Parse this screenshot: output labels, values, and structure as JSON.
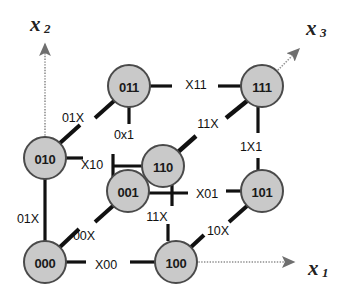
{
  "figure": {
    "type": "diagram",
    "subtype": "binary-hypercube-3d",
    "background_color": "#ffffff",
    "node_fill": "#c9c9c9",
    "node_stroke": "#4a4a4a",
    "edge_color": "#111111",
    "axis_color": "#8a8a8a",
    "thin_edge_color": "#6e6e6e"
  },
  "axes": [
    {
      "id": "x1",
      "base": "x",
      "sub": "1",
      "x": 316,
      "y": 268,
      "arrow_from": [
        176,
        262
      ],
      "arrow_to": [
        296,
        262
      ],
      "style": "dotted"
    },
    {
      "id": "x2",
      "base": "x",
      "sub": "2",
      "x": 38,
      "y": 24,
      "arrow_from": [
        45,
        158
      ],
      "arrow_to": [
        45,
        42
      ],
      "style": "dotted"
    },
    {
      "id": "x3",
      "base": "x",
      "sub": "3",
      "x": 314,
      "y": 28,
      "arrow_from": [
        262,
        86
      ],
      "arrow_to": [
        300,
        48
      ],
      "style": "dotted"
    }
  ],
  "nodes": [
    {
      "id": "000",
      "label": "000",
      "cx": 45,
      "cy": 262,
      "r": 21
    },
    {
      "id": "010",
      "label": "010",
      "cx": 45,
      "cy": 158,
      "r": 21
    },
    {
      "id": "100",
      "label": "100",
      "cx": 176,
      "cy": 262,
      "r": 21
    },
    {
      "id": "110",
      "label": "110",
      "cx": 163,
      "cy": 166,
      "r": 21
    },
    {
      "id": "001",
      "label": "001",
      "cx": 128,
      "cy": 191,
      "r": 21
    },
    {
      "id": "011",
      "label": "011",
      "cx": 129,
      "cy": 86,
      "r": 21
    },
    {
      "id": "101",
      "label": "101",
      "cx": 262,
      "cy": 191,
      "r": 21
    },
    {
      "id": "111",
      "label": "111",
      "cx": 262,
      "cy": 86,
      "r": 21
    }
  ],
  "edge_labels": [
    {
      "id": "label-01X-upper",
      "text": "01X",
      "x": 73,
      "y": 118
    },
    {
      "id": "label-01X-lower",
      "text": "01X",
      "x": 28,
      "y": 219
    },
    {
      "id": "label-00X",
      "text": "00X",
      "x": 84,
      "y": 236
    },
    {
      "id": "label-X00",
      "text": "X00",
      "x": 106,
      "y": 265
    },
    {
      "id": "label-X10",
      "text": "X10",
      "x": 92,
      "y": 165
    },
    {
      "id": "label-0x1",
      "text": "0x1",
      "x": 124,
      "y": 135
    },
    {
      "id": "label-X11",
      "text": "X11",
      "x": 196,
      "y": 85
    },
    {
      "id": "label-11X-upper",
      "text": "11X",
      "x": 208,
      "y": 124
    },
    {
      "id": "label-11X-lower",
      "text": "11X",
      "x": 157,
      "y": 217
    },
    {
      "id": "label-1X1",
      "text": "1X1",
      "x": 251,
      "y": 147
    },
    {
      "id": "label-X01",
      "text": "X01",
      "x": 207,
      "y": 194
    },
    {
      "id": "label-10X",
      "text": "10X",
      "x": 218,
      "y": 231
    }
  ],
  "edges": [
    {
      "id": "edge-000-010",
      "from": "000",
      "to": "010",
      "kind": "vertical",
      "label": "01X"
    },
    {
      "id": "edge-000-00X",
      "from": "000",
      "to": null,
      "kind": "diagonal",
      "label": "00X"
    },
    {
      "id": "edge-000-X00",
      "from": "000",
      "to": null,
      "kind": "horizontal",
      "label": "X00"
    },
    {
      "id": "edge-010-01X",
      "from": "010",
      "to": null,
      "kind": "diagonal",
      "label": "01X"
    },
    {
      "id": "edge-010-X10",
      "from": "010",
      "to": null,
      "kind": "horizontal",
      "label": "X10"
    },
    {
      "id": "edge-011-0x1",
      "from": "011",
      "to": null,
      "kind": "vertical",
      "label": "0x1"
    },
    {
      "id": "edge-011-01X",
      "from": "011",
      "to": null,
      "kind": "diagonal",
      "label": "01X"
    },
    {
      "id": "edge-011-X11",
      "from": "011",
      "to": null,
      "kind": "horizontal",
      "label": "X11"
    },
    {
      "id": "edge-100-11X",
      "from": "100",
      "to": null,
      "kind": "vertical",
      "label": "11X"
    },
    {
      "id": "edge-100-10X",
      "from": "100",
      "to": null,
      "kind": "diagonal",
      "label": "10X"
    },
    {
      "id": "edge-110-11X",
      "from": "110",
      "to": null,
      "kind": "diagonal",
      "label": "11X"
    },
    {
      "id": "edge-110-X10",
      "from": "110",
      "to": null,
      "kind": "horizontal",
      "label": "X10"
    },
    {
      "id": "edge-001-X01",
      "from": "001",
      "to": null,
      "kind": "horizontal",
      "label": "X01"
    },
    {
      "id": "edge-001-00X",
      "from": "001",
      "to": null,
      "kind": "diagonal",
      "label": "00X"
    },
    {
      "id": "edge-001-110",
      "from": "001",
      "to": "110",
      "kind": "thin",
      "label": ""
    },
    {
      "id": "edge-101-1X1",
      "from": "101",
      "to": null,
      "kind": "vertical",
      "label": "1X1"
    },
    {
      "id": "edge-101-X01",
      "from": "101",
      "to": null,
      "kind": "horizontal",
      "label": "X01"
    },
    {
      "id": "edge-101-10X",
      "from": "101",
      "to": null,
      "kind": "diagonal",
      "label": "10X"
    },
    {
      "id": "edge-111-1X1",
      "from": "111",
      "to": "101",
      "kind": "vertical",
      "label": "1X1"
    },
    {
      "id": "edge-111-X11",
      "from": "111",
      "to": null,
      "kind": "horizontal",
      "label": "X11"
    },
    {
      "id": "edge-111-11X",
      "from": "111",
      "to": null,
      "kind": "diagonal",
      "label": "11X"
    }
  ]
}
